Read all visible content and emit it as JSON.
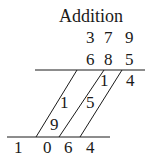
{
  "title": "Addition",
  "addends": [
    {
      "digits": [
        "3",
        "7",
        "9"
      ]
    },
    {
      "digits": [
        "6",
        "8",
        "5"
      ]
    }
  ],
  "partial_sums": {
    "diagonal_1": {
      "tens": "1",
      "ones": "9"
    },
    "diagonal_2": {
      "tens": "1",
      "ones": "5"
    },
    "diagonal_3": {
      "tens": "1",
      "ones": "4"
    }
  },
  "result": {
    "digits": [
      "1",
      "0",
      "6",
      "4"
    ],
    "value": "1064"
  },
  "colors": {
    "ink": "#1a1a1a",
    "background": "#ffffff"
  }
}
